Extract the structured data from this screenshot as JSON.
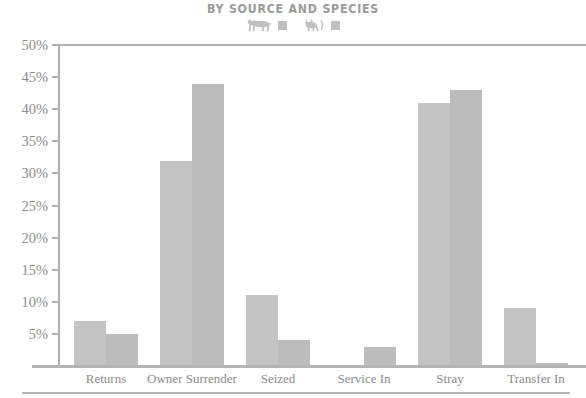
{
  "chart_data": {
    "type": "bar",
    "title": "BY SOURCE AND SPECIES",
    "xlabel": "",
    "ylabel": "",
    "ylim": [
      0,
      50
    ],
    "grid": false,
    "legend_position": "top-center",
    "categories": [
      "Returns",
      "Owner Surrender",
      "Seized",
      "Service In",
      "Stray",
      "Transfer In"
    ],
    "ytick_labels": [
      "50%",
      "45%",
      "40%",
      "35%",
      "30%",
      "25%",
      "20%",
      "15%",
      "10%",
      "5%"
    ],
    "ytick_values": [
      50,
      45,
      40,
      35,
      30,
      25,
      20,
      15,
      10,
      5
    ],
    "series": [
      {
        "name": "Dogs",
        "icon": "dog-icon",
        "color": "#c4c4c4",
        "values": [
          7,
          32,
          11,
          0,
          41,
          9
        ]
      },
      {
        "name": "Cats",
        "icon": "cat-icon",
        "color": "#bcbcbc",
        "values": [
          5,
          44,
          4,
          3,
          43,
          0.5
        ]
      }
    ]
  },
  "legend": {
    "entries": [
      {
        "icon": "dog-icon",
        "swatch_color": "#c0c0c0"
      },
      {
        "icon": "cat-icon",
        "swatch_color": "#c0c0c0"
      }
    ]
  },
  "axis": {
    "value_suffix": "%",
    "axis_color": "#b0b0b0",
    "label_color": "#8d8d8d"
  }
}
